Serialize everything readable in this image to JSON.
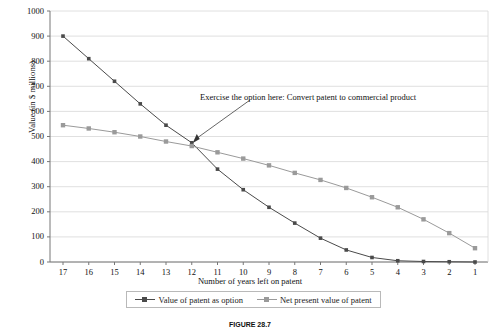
{
  "chart_data": {
    "type": "line",
    "title": "",
    "xlabel": "Number of years left on patent",
    "ylabel": "Value (in $ millions)",
    "x": [
      17,
      16,
      15,
      14,
      13,
      12,
      11,
      10,
      9,
      8,
      7,
      6,
      5,
      4,
      3,
      2,
      1
    ],
    "categories": [
      "17",
      "16",
      "15",
      "14",
      "13",
      "12",
      "11",
      "10",
      "9",
      "8",
      "7",
      "6",
      "5",
      "4",
      "3",
      "2",
      "1"
    ],
    "xticklabels": [
      "17",
      "16",
      "15",
      "14",
      "13",
      "12",
      "11",
      "10",
      "9",
      "8",
      "7",
      "6",
      "5",
      "4",
      "3",
      "2",
      "1"
    ],
    "yticklabels": [
      "1000",
      "900",
      "800",
      "700",
      "600",
      "500",
      "400",
      "300",
      "200",
      "100",
      "0"
    ],
    "yticks": [
      1000,
      900,
      800,
      700,
      600,
      500,
      400,
      300,
      200,
      100,
      0
    ],
    "ylim": [
      0,
      1000
    ],
    "x_axis_direction": "descending",
    "grid": "horizontal",
    "legend_position": "bottom",
    "series": [
      {
        "name": "Value of patent as option",
        "marker": "dot",
        "color": "#4a4a4a",
        "values": [
          900,
          810,
          720,
          630,
          545,
          475,
          370,
          288,
          218,
          155,
          95,
          48,
          18,
          5,
          2,
          1,
          0
        ]
      },
      {
        "name": "Net present value of patent",
        "marker": "square",
        "color": "#9a9a9a",
        "values": [
          545,
          532,
          517,
          500,
          480,
          462,
          437,
          412,
          385,
          355,
          327,
          295,
          258,
          218,
          170,
          115,
          55
        ]
      }
    ],
    "annotations": [
      {
        "text": "Exercise the option here: Convert patent to commercial product",
        "points_to_x": 12,
        "points_to_y": 470
      }
    ]
  },
  "figure": {
    "caption_label": "FIGURE 28.7",
    "caption_text": ""
  }
}
